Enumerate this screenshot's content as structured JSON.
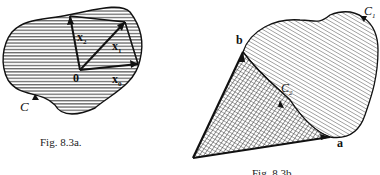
{
  "figure_a": {
    "caption": "Fig. 8.3a.",
    "curve_label": "C",
    "origin_label": "0",
    "vectors": [
      "x",
      "x",
      "x"
    ],
    "vector_subscripts": [
      "0",
      "1",
      "2"
    ]
  },
  "figure_b": {
    "caption": "Fig. 8.3b.",
    "vector_a": "a",
    "vector_b": "b",
    "curve_outer": "C",
    "curve_outer_sub": "1",
    "curve_inner": "C",
    "curve_inner_sub": "2"
  }
}
